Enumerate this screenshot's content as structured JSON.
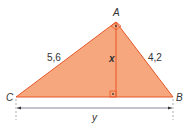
{
  "diagram": {
    "type": "right-triangle-with-altitude",
    "vertices": {
      "A": {
        "label": "A",
        "x": 116,
        "y": 22
      },
      "B": {
        "label": "B",
        "x": 173,
        "y": 97
      },
      "C": {
        "label": "C",
        "x": 16,
        "y": 97
      }
    },
    "foot": {
      "x": 116,
      "y": 97
    },
    "sides": {
      "CA": {
        "label": "5,6"
      },
      "AB": {
        "label": "4,2"
      },
      "altitude": {
        "label": "x"
      },
      "CB": {
        "label": "y"
      }
    },
    "right_angle_markers": [
      "A",
      "altitude-foot"
    ],
    "colors": {
      "fill": "#f6a77d",
      "stroke": "#e8572a",
      "dimension": "#6b6b8a",
      "text": "#333333"
    }
  }
}
